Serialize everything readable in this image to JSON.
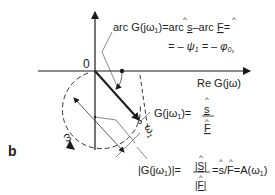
{
  "figure": {
    "panel_label": "b",
    "origin_label": "0",
    "axis_label": "Re G(jω)",
    "arc_label_line1_parts": [
      "arc G(jω",
      "1",
      ")=arc ",
      "s",
      "–arc ",
      "F",
      "="
    ],
    "arc_label_line2_parts": [
      "= – ψ",
      "1",
      " = – φ",
      "0",
      "s"
    ],
    "g_label_parts": [
      "G(jω",
      "1",
      ")="
    ],
    "g_numerator": "s",
    "g_denominator": "F",
    "omega_label": "ω",
    "omega1_label": "ω",
    "omega1_sub": "1",
    "magnitude_label_parts": [
      "|G(jω",
      "1",
      ")|="
    ],
    "magnitude_numerator": "|S|",
    "magnitude_denominator": "|F|",
    "magnitude_tail_parts": [
      "=",
      "s",
      "/",
      "F",
      "=A(ω",
      "1",
      ")"
    ]
  },
  "colors": {
    "line": "#1a1a1a",
    "thin_line": "#555555",
    "text": "#222222"
  }
}
